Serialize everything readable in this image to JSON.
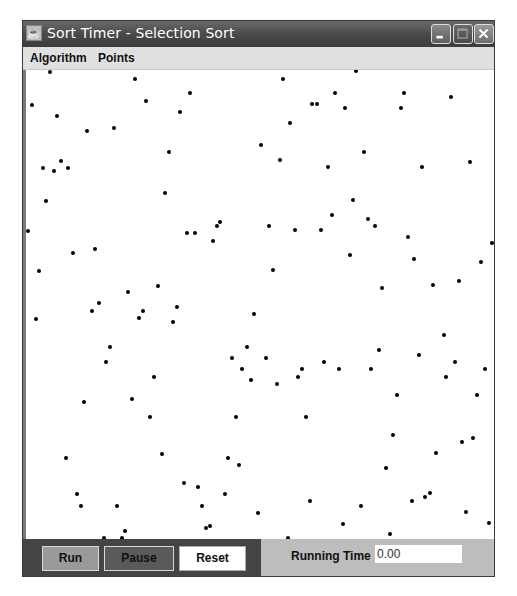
{
  "window": {
    "title": "Sort Timer - Selection Sort",
    "icon": "java-app-icon",
    "controls": [
      "minimize",
      "maximize",
      "close"
    ]
  },
  "menubar": {
    "items": [
      {
        "label": "Algorithm"
      },
      {
        "label": "Points"
      }
    ]
  },
  "canvas": {
    "description": "scatter of points to be sorted",
    "point_color": "#000000",
    "points": [
      [
        50,
        72
      ],
      [
        135,
        79
      ],
      [
        283,
        79
      ],
      [
        356,
        71
      ],
      [
        32,
        105
      ],
      [
        146,
        101
      ],
      [
        57,
        116
      ],
      [
        190,
        93
      ],
      [
        180,
        112
      ],
      [
        87,
        131
      ],
      [
        114,
        128
      ],
      [
        335,
        93
      ],
      [
        404,
        93
      ],
      [
        451,
        97
      ],
      [
        312,
        104
      ],
      [
        317,
        104
      ],
      [
        345,
        108
      ],
      [
        401,
        108
      ],
      [
        290,
        123
      ],
      [
        169,
        152
      ],
      [
        261,
        145
      ],
      [
        43,
        168
      ],
      [
        61,
        161
      ],
      [
        54,
        171
      ],
      [
        68,
        168
      ],
      [
        280,
        160
      ],
      [
        364,
        152
      ],
      [
        328,
        167
      ],
      [
        422,
        167
      ],
      [
        470,
        162
      ],
      [
        46,
        201
      ],
      [
        165,
        193
      ],
      [
        28,
        231
      ],
      [
        187,
        233
      ],
      [
        195,
        233
      ],
      [
        217,
        226
      ],
      [
        220,
        222
      ],
      [
        213,
        241
      ],
      [
        73,
        253
      ],
      [
        95,
        249
      ],
      [
        39,
        271
      ],
      [
        269,
        226
      ],
      [
        353,
        200
      ],
      [
        332,
        215
      ],
      [
        368,
        219
      ],
      [
        375,
        226
      ],
      [
        295,
        230
      ],
      [
        321,
        230
      ],
      [
        408,
        237
      ],
      [
        492,
        243
      ],
      [
        350,
        255
      ],
      [
        414,
        259
      ],
      [
        481,
        262
      ],
      [
        273,
        270
      ],
      [
        382,
        288
      ],
      [
        433,
        285
      ],
      [
        459,
        281
      ],
      [
        128,
        292
      ],
      [
        158,
        286
      ],
      [
        99,
        303
      ],
      [
        92,
        311
      ],
      [
        36,
        319
      ],
      [
        143,
        311
      ],
      [
        139,
        318
      ],
      [
        177,
        307
      ],
      [
        173,
        322
      ],
      [
        254,
        314
      ],
      [
        110,
        347
      ],
      [
        106,
        362
      ],
      [
        232,
        358
      ],
      [
        247,
        347
      ],
      [
        242,
        369
      ],
      [
        266,
        358
      ],
      [
        251,
        380
      ],
      [
        154,
        377
      ],
      [
        132,
        399
      ],
      [
        84,
        402
      ],
      [
        444,
        335
      ],
      [
        379,
        350
      ],
      [
        419,
        355
      ],
      [
        324,
        362
      ],
      [
        455,
        362
      ],
      [
        302,
        369
      ],
      [
        339,
        369
      ],
      [
        371,
        369
      ],
      [
        446,
        377
      ],
      [
        485,
        369
      ],
      [
        298,
        377
      ],
      [
        277,
        384
      ],
      [
        397,
        395
      ],
      [
        477,
        395
      ],
      [
        150,
        417
      ],
      [
        236,
        417
      ],
      [
        162,
        454
      ],
      [
        66,
        458
      ],
      [
        228,
        458
      ],
      [
        239,
        465
      ],
      [
        184,
        483
      ],
      [
        198,
        487
      ],
      [
        77,
        494
      ],
      [
        225,
        494
      ],
      [
        81,
        506
      ],
      [
        117,
        506
      ],
      [
        202,
        506
      ],
      [
        258,
        513
      ],
      [
        125,
        531
      ],
      [
        206,
        528
      ],
      [
        210,
        526
      ],
      [
        104,
        538
      ],
      [
        122,
        538
      ],
      [
        306,
        417
      ],
      [
        393,
        435
      ],
      [
        462,
        442
      ],
      [
        473,
        438
      ],
      [
        436,
        453
      ],
      [
        386,
        468
      ],
      [
        310,
        501
      ],
      [
        361,
        506
      ],
      [
        412,
        501
      ],
      [
        425,
        497
      ],
      [
        430,
        493
      ],
      [
        466,
        512
      ],
      [
        343,
        524
      ],
      [
        489,
        523
      ],
      [
        390,
        534
      ],
      [
        288,
        538
      ]
    ]
  },
  "controls": {
    "run_label": "Run",
    "pause_label": "Pause",
    "reset_label": "Reset",
    "running_time_label": "Running Time",
    "running_time_value": "0.00"
  },
  "colors": {
    "titlebar": "#4a4a4a",
    "left_panel": "#444444",
    "right_panel": "#bdbdbd",
    "run_button": "#9a9a9a",
    "pause_button": "#5a5a5a",
    "reset_button": "#ffffff"
  }
}
